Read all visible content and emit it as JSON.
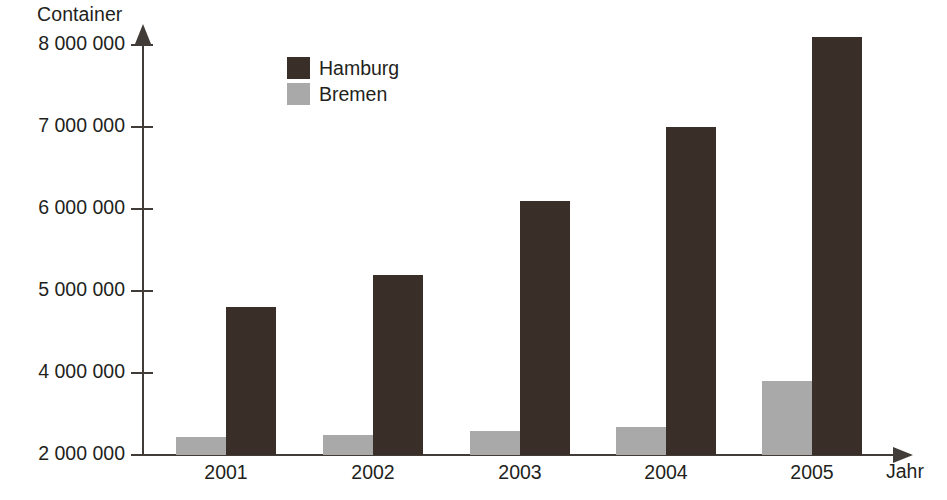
{
  "chart_data": {
    "type": "bar",
    "title": "",
    "xlabel": "Jahr",
    "ylabel": "Container",
    "categories": [
      "2001",
      "2002",
      "2003",
      "2004",
      "2005"
    ],
    "series": [
      {
        "name": "Hamburg",
        "color": "#3a2e28",
        "values": [
          4800000,
          5200000,
          6100000,
          7000000,
          8100000
        ]
      },
      {
        "name": "Bremen",
        "color": "#a9a9a9",
        "values": [
          2450000,
          2500000,
          2580000,
          2680000,
          3800000
        ]
      }
    ],
    "ytick_labels": [
      "8 000 000",
      "7 000 000",
      "6 000 000",
      "5 000 000",
      "4 000 000",
      "2 000 000"
    ],
    "ytick_values": [
      8000000,
      7000000,
      6000000,
      5000000,
      4000000,
      2000000
    ],
    "ylim": [
      2000000,
      8400000
    ],
    "axis_note": "broken axis: no 3 000 000 tick; 2 000 000 baseline compressed",
    "grid": false,
    "legend_position": "top-left-inside",
    "axis_color": "#423c38"
  },
  "legend": {
    "entries": [
      {
        "label": "Hamburg"
      },
      {
        "label": "Bremen"
      }
    ]
  },
  "axes": {
    "y_title": "Container",
    "x_title": "Jahr"
  }
}
